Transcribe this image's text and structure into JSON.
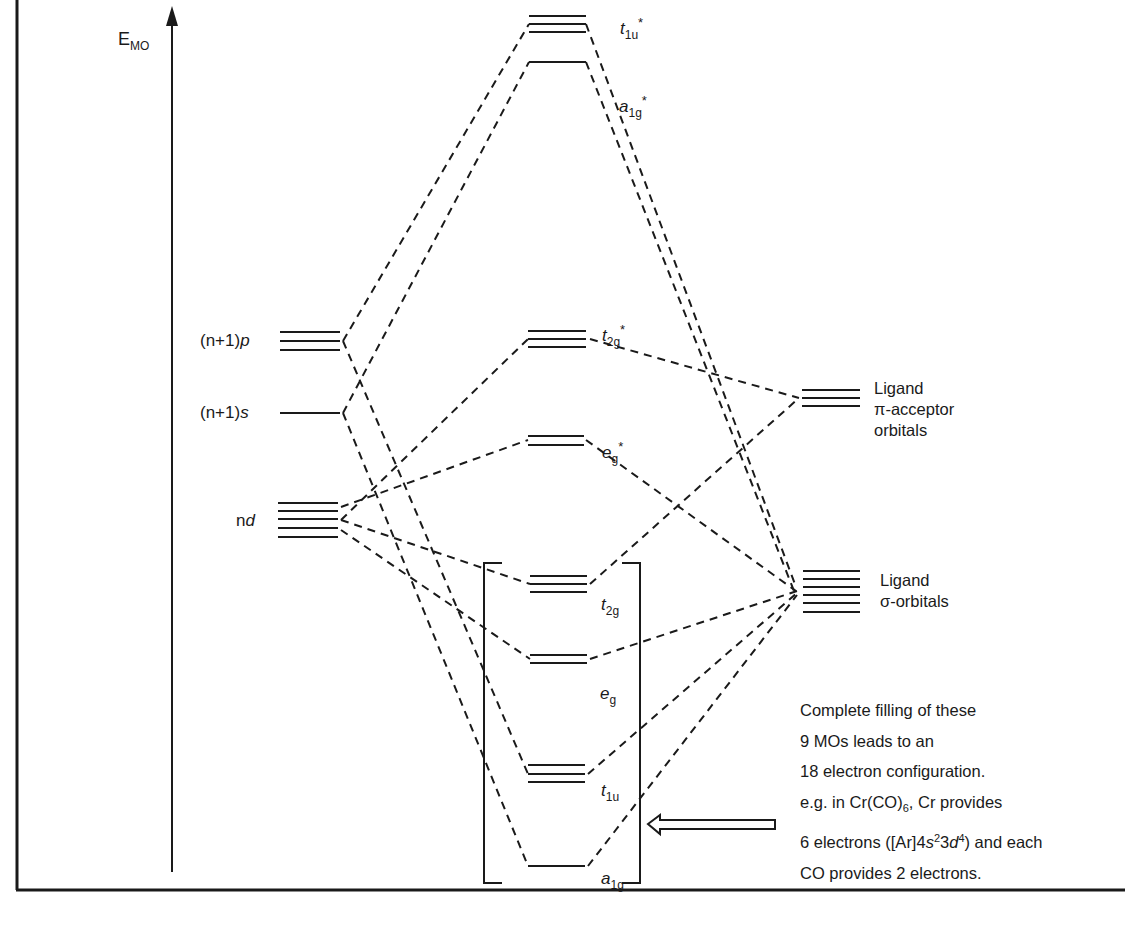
{
  "axis": {
    "label_main": "E",
    "label_sub": "MO"
  },
  "metal_orbitals": {
    "np": {
      "prefix": "(n+1)",
      "italic": "p",
      "degeneracy": 3
    },
    "ns": {
      "prefix": "(n+1)",
      "italic": "s",
      "degeneracy": 1
    },
    "nd": {
      "prefix": "n",
      "italic": "d",
      "degeneracy": 5
    }
  },
  "molecular_orbitals": [
    {
      "id": "t1u_star",
      "base": "t",
      "sub": "1u",
      "sup": "*",
      "degeneracy": 3
    },
    {
      "id": "a1g_star",
      "base": "a",
      "sub": "1g",
      "sup": "*",
      "degeneracy": 1
    },
    {
      "id": "t2g_star",
      "base": "t",
      "sub": "2g",
      "sup": "*",
      "degeneracy": 3
    },
    {
      "id": "eg_star",
      "base": "e",
      "sub": "g",
      "sup": "*",
      "degeneracy": 2
    },
    {
      "id": "t2g",
      "base": "t",
      "sub": "2g",
      "sup": "",
      "degeneracy": 3
    },
    {
      "id": "eg",
      "base": "e",
      "sub": "g",
      "sup": "",
      "degeneracy": 2
    },
    {
      "id": "t1u",
      "base": "t",
      "sub": "1u",
      "sup": "",
      "degeneracy": 3
    },
    {
      "id": "a1g",
      "base": "a",
      "sub": "1g",
      "sup": "",
      "degeneracy": 1
    }
  ],
  "ligand_orbitals": {
    "pi": {
      "line1": "Ligand",
      "line2": "π-acceptor",
      "line3": "orbitals",
      "degeneracy": 3
    },
    "sigma": {
      "line1": "Ligand",
      "line2": "σ-orbitals",
      "degeneracy": 6
    }
  },
  "note": {
    "line1": "Complete filling of these",
    "line2": "9 MOs leads to an",
    "line3": "18 electron configuration.",
    "line4_a": "e.g. in Cr(CO)",
    "line4_sub": "6",
    "line4_b": ", Cr  provides",
    "line5_a": "6 electrons ([Ar]4",
    "line5_s": "s",
    "line5_sup1": "2",
    "line5_b": "3",
    "line5_d": "d",
    "line5_sup2": "4",
    "line5_c": ") and each",
    "line6": "CO  provides 2 electrons."
  }
}
